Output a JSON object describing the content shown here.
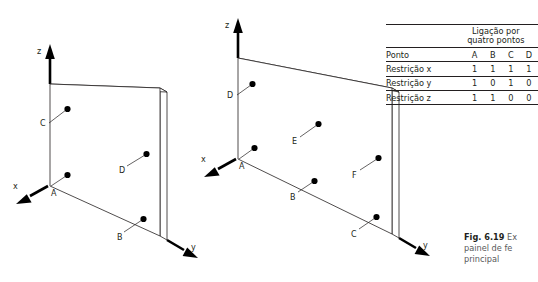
{
  "figure": {
    "caption_number": "Fig. 6.19",
    "caption_line1_rest": " Ex",
    "caption_line2": "painel de fe",
    "caption_line3": "principal"
  },
  "diagrams": [
    {
      "id": "left-panel",
      "name": "four-point-connection-panel",
      "axes": [
        {
          "name": "z",
          "label": "z"
        },
        {
          "name": "x",
          "label": "x"
        },
        {
          "name": "y",
          "label": "y"
        }
      ],
      "points": [
        {
          "label": "C"
        },
        {
          "label": "A"
        },
        {
          "label": "D"
        },
        {
          "label": "B"
        }
      ]
    },
    {
      "id": "right-panel",
      "name": "six-point-connection-panel",
      "axes": [
        {
          "name": "z",
          "label": "z"
        },
        {
          "name": "x",
          "label": "x"
        },
        {
          "name": "y",
          "label": "y"
        }
      ],
      "points": [
        {
          "label": "D"
        },
        {
          "label": "A"
        },
        {
          "label": "E"
        },
        {
          "label": "B"
        },
        {
          "label": "F"
        },
        {
          "label": "C"
        }
      ]
    }
  ],
  "table": {
    "group_header_line1": "Ligação por",
    "group_header_line2": "quatro pontos",
    "row_header_label": "Ponto",
    "columns": [
      "A",
      "B",
      "C",
      "D"
    ],
    "rows": [
      {
        "label": "Restrição x",
        "values": [
          "1",
          "1",
          "1",
          "1"
        ]
      },
      {
        "label": "Restrição y",
        "values": [
          "1",
          "0",
          "1",
          "0"
        ]
      },
      {
        "label": "Restrição z",
        "values": [
          "1",
          "1",
          "0",
          "0"
        ]
      }
    ]
  },
  "colors": {
    "ink": "#231f20",
    "caption": "#58595b",
    "dot": "#000000"
  }
}
